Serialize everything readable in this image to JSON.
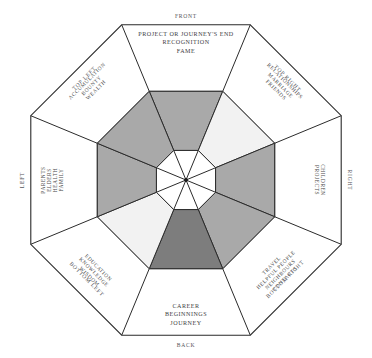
{
  "diagram": {
    "shape": "octagon",
    "center_dot": true,
    "colors": {
      "stroke": "#2b2b2b",
      "background": "#ffffff",
      "fill_light": "#f2f2f2",
      "fill_medium": "#a9a9a9",
      "fill_dark": "#7d7d7d",
      "text": "#4a4a4a"
    },
    "sectors": [
      {
        "id": "front",
        "direction": "FRONT",
        "direction_position": "top",
        "keywords": [
          "PROJECT OR JOURNEY'S END",
          "RECOGNITION",
          "FAME"
        ],
        "shade": "medium",
        "fill": "#a9a9a9",
        "level": 1.0
      },
      {
        "id": "top-right",
        "direction": "TOP RIGHT",
        "direction_position": "upper-right",
        "keywords": [
          "RELATIONSHIPS",
          "MARRIAGE",
          "FRIENDS"
        ],
        "shade": "light",
        "fill": "#f2f2f2",
        "level": 1.0
      },
      {
        "id": "right",
        "direction": "RIGHT",
        "direction_position": "right",
        "keywords": [
          "CHILDREN",
          "PROJECTS"
        ],
        "shade": "medium",
        "fill": "#a9a9a9",
        "level": 1.0
      },
      {
        "id": "bottom-right",
        "direction": "BOTTOM RIGHT",
        "direction_position": "lower-right",
        "keywords": [
          "CONTACTS",
          "NEIGHBOURS",
          "HELPFUL PEOPLE",
          "TRAVEL"
        ],
        "shade": "medium",
        "fill": "#a9a9a9",
        "level": 1.0
      },
      {
        "id": "back",
        "direction": "BACK",
        "direction_position": "bottom",
        "keywords": [
          "CAREER",
          "BEGINNINGS",
          "JOURNEY"
        ],
        "shade": "dark",
        "fill": "#7d7d7d",
        "level": 1.0
      },
      {
        "id": "bottom-left",
        "direction": "BOTTOM LEFT",
        "direction_position": "lower-left",
        "keywords": [
          "WISDOM",
          "KNOWLEDGE",
          "EDUCATION"
        ],
        "shade": "light",
        "fill": "#f2f2f2",
        "level": 1.0
      },
      {
        "id": "left",
        "direction": "LEFT",
        "direction_position": "left",
        "keywords": [
          "PARENTS",
          "ELDERS",
          "HEALTH",
          "FAMILY"
        ],
        "shade": "medium",
        "fill": "#a9a9a9",
        "level": 1.0
      },
      {
        "id": "top-left",
        "direction": "TOP LEFT",
        "direction_position": "upper-left",
        "keywords": [
          "ACCUMULATION",
          "BOUNTY",
          "WEALTH"
        ],
        "shade": "medium",
        "fill": "#a9a9a9",
        "level": 1.0
      }
    ]
  }
}
